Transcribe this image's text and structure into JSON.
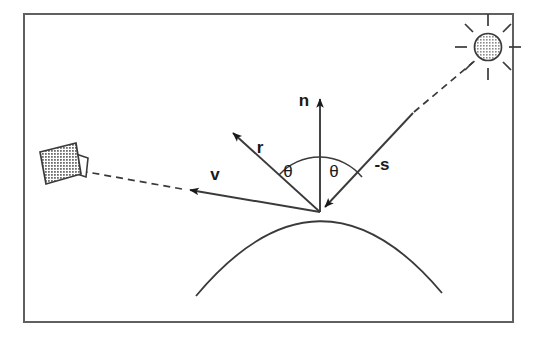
{
  "figure": {
    "background_color": "#ffffff",
    "stroke_color": "#333333",
    "frame": {
      "name": "figure-border",
      "x": 23,
      "y": 13,
      "width": 490,
      "height": 309,
      "border_color": "#555555",
      "border_width": 2
    }
  },
  "labels": {
    "normal": "n",
    "reflection": "r",
    "view": "v",
    "light": "-s",
    "angle_left": "θ",
    "angle_right": "θ"
  },
  "objects": {
    "light_source": {
      "name": "sun",
      "fill": "#b0b0b0",
      "center_x": 488,
      "center_y": 47,
      "radius": 13,
      "ray_count": 8
    },
    "camera": {
      "name": "camera",
      "fill": "#808080",
      "body_center_x": 57,
      "body_center_y": 163
    },
    "surface": {
      "name": "curved-surface",
      "apex_x": 320,
      "apex_y": 212,
      "left_x": 196,
      "left_y": 296,
      "right_x": 442,
      "right_y": 293
    },
    "hit_point": {
      "name": "surface-intersection-point",
      "x": 320,
      "y": 212
    }
  },
  "vectors": {
    "n": {
      "from_x": 320,
      "from_y": 212,
      "to_x": 320,
      "to_y": 95,
      "style": "solid",
      "label_x": 304,
      "label_y": 106
    },
    "r": {
      "from_x": 320,
      "from_y": 212,
      "to_x": 229,
      "to_y": 129,
      "style": "solid",
      "label_x": 259,
      "label_y": 150
    },
    "v": {
      "from_x": 320,
      "from_y": 212,
      "to_x": 185,
      "to_y": 189,
      "style": "solid",
      "label_x": 215,
      "label_y": 178,
      "dashed_to_x": 86,
      "dashed_to_y": 172
    },
    "minus_s": {
      "from_x": 413,
      "from_y": 113,
      "to_x": 320,
      "to_y": 212,
      "style": "solid",
      "label_x": 378,
      "label_y": 167,
      "dashed_to_x": 477,
      "dashed_to_y": 58
    }
  },
  "angle_arc": {
    "center_x": 320,
    "center_y": 212,
    "radius": 55,
    "left_label_x": 288,
    "left_label_y": 173,
    "right_label_x": 332,
    "right_label_y": 173
  }
}
